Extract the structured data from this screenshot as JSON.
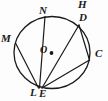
{
  "figure": {
    "kind": "circle-geometry-diagram",
    "width": 108,
    "height": 101,
    "background_color": "#fdfdfd",
    "stroke_color": "#1a1a1a",
    "circle": {
      "center_label": "O",
      "center_x": 52,
      "center_y": 52,
      "radius": 37,
      "center_dot_x": 51,
      "center_dot_y": 53
    },
    "points": [
      {
        "id": "N",
        "label": "N",
        "x": 45,
        "y": 16
      },
      {
        "id": "D",
        "label": "D",
        "x": 79,
        "y": 25
      },
      {
        "id": "C",
        "label": "C",
        "x": 89,
        "y": 60
      },
      {
        "id": "M",
        "label": "M",
        "x": 17,
        "y": 43
      },
      {
        "id": "L",
        "label": "L",
        "x": 38,
        "y": 88
      },
      {
        "id": "E",
        "label": "E",
        "x": 42,
        "y": 88
      },
      {
        "id": "H",
        "label": "H",
        "x": 82,
        "y": 4
      }
    ],
    "chords": [
      {
        "id": "chord-N-L",
        "from": "N",
        "to": "L"
      },
      {
        "id": "chord-M-E",
        "from": "M",
        "to": "E"
      },
      {
        "id": "chord-D-E",
        "from": "D",
        "to": "E"
      },
      {
        "id": "chord-C-E",
        "from": "C",
        "to": "E"
      },
      {
        "id": "chord-D-C",
        "from": "D",
        "to": "C"
      }
    ],
    "labels": {
      "N": "N",
      "H": "H",
      "D": "D",
      "M": "M",
      "C": "C",
      "L": "L",
      "E": "E",
      "O": "O"
    }
  }
}
